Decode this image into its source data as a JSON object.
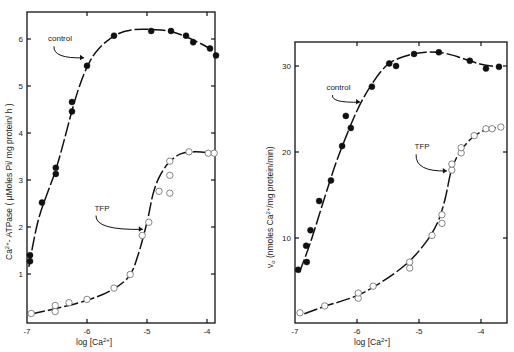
{
  "chart_data": [
    {
      "type": "scatter",
      "panel": "left",
      "title": "",
      "xlabel": "log [Ca2+]",
      "ylabel": "Ca2+-ATPase ( µMoles Pi/ mg protein/ h )",
      "xlim": [
        -7,
        -3.8
      ],
      "ylim": [
        0,
        6.6
      ],
      "xticks": [
        -7,
        -6,
        -5,
        -4
      ],
      "yticks": [
        1,
        2,
        3,
        4,
        5,
        6
      ],
      "grid": false,
      "frame": {
        "left": 27,
        "right": 215,
        "top": 12,
        "bottom": 323,
        "x0px": 27,
        "x1px": 87,
        "y0px": 321,
        "y1px": 274
      },
      "series": [
        {
          "name": "control",
          "marker": "filled-circle",
          "points": [
            [
              -6.95,
              1.27
            ],
            [
              -6.95,
              1.4
            ],
            [
              -6.75,
              2.52
            ],
            [
              -6.52,
              3.13
            ],
            [
              -6.52,
              3.26
            ],
            [
              -6.25,
              4.46
            ],
            [
              -6.25,
              4.66
            ],
            [
              -6.0,
              5.43
            ],
            [
              -5.55,
              6.07
            ],
            [
              -4.93,
              6.17
            ],
            [
              -4.6,
              6.17
            ],
            [
              -4.35,
              6.07
            ],
            [
              -4.23,
              5.93
            ],
            [
              -3.95,
              5.8
            ],
            [
              -3.85,
              5.65
            ]
          ],
          "curve": [
            [
              -6.97,
              1.15
            ],
            [
              -6.8,
              2.2
            ],
            [
              -6.5,
              3.3
            ],
            [
              -6.2,
              4.7
            ],
            [
              -6.0,
              5.4
            ],
            [
              -5.8,
              5.8
            ],
            [
              -5.5,
              6.1
            ],
            [
              -5.2,
              6.2
            ],
            [
              -4.9,
              6.2
            ],
            [
              -4.6,
              6.16
            ],
            [
              -4.3,
              6.02
            ],
            [
              -4.0,
              5.83
            ],
            [
              -3.85,
              5.66
            ]
          ]
        },
        {
          "name": "TFP",
          "marker": "open-circle",
          "points": [
            [
              -6.93,
              0.16
            ],
            [
              -6.53,
              0.2
            ],
            [
              -6.53,
              0.33
            ],
            [
              -6.3,
              0.39
            ],
            [
              -6.0,
              0.46
            ],
            [
              -5.55,
              0.7
            ],
            [
              -5.28,
              0.99
            ],
            [
              -5.08,
              1.82
            ],
            [
              -4.97,
              2.1
            ],
            [
              -4.8,
              2.76
            ],
            [
              -4.62,
              2.72
            ],
            [
              -4.62,
              3.1
            ],
            [
              -4.62,
              3.4
            ],
            [
              -4.3,
              3.6
            ],
            [
              -3.98,
              3.57
            ],
            [
              -3.88,
              3.57
            ]
          ],
          "curve": [
            [
              -6.93,
              0.15
            ],
            [
              -6.5,
              0.27
            ],
            [
              -6.0,
              0.44
            ],
            [
              -5.6,
              0.65
            ],
            [
              -5.3,
              0.95
            ],
            [
              -5.15,
              1.4
            ],
            [
              -5.0,
              2.1
            ],
            [
              -4.9,
              2.7
            ],
            [
              -4.8,
              3.05
            ],
            [
              -4.65,
              3.35
            ],
            [
              -4.45,
              3.55
            ],
            [
              -4.2,
              3.6
            ],
            [
              -3.95,
              3.58
            ]
          ]
        }
      ],
      "annotations": [
        {
          "text": "control",
          "x": -6.45,
          "y": 5.95,
          "arrow_to": [
            -6.05,
            5.6
          ]
        },
        {
          "text": "TFP",
          "x": -5.75,
          "y": 2.35,
          "arrow_to": [
            -5.07,
            1.95
          ]
        }
      ]
    },
    {
      "type": "scatter",
      "panel": "right",
      "title": "",
      "xlabel": "log [Ca2+]",
      "ylabel": "vo (nmoles Ca2+/mg protein/min)",
      "xlim": [
        -7,
        -3.6
      ],
      "ylim": [
        0,
        32.8
      ],
      "xticks": [
        -7,
        -6,
        -5,
        -4
      ],
      "yticks": [
        10,
        20,
        30
      ],
      "grid": false,
      "frame": {
        "left": 295,
        "right": 507,
        "top": 42,
        "bottom": 323,
        "x0px": 295,
        "x1px": 357,
        "y0px": 324,
        "y1px": 238
      },
      "series": [
        {
          "name": "control",
          "marker": "filled-circle",
          "points": [
            [
              -6.95,
              6.3
            ],
            [
              -6.81,
              7.2
            ],
            [
              -6.82,
              9.1
            ],
            [
              -6.75,
              10.9
            ],
            [
              -6.61,
              14.3
            ],
            [
              -6.42,
              16.7
            ],
            [
              -6.24,
              20.7
            ],
            [
              -6.18,
              24.2
            ],
            [
              -6.1,
              22.8
            ],
            [
              -5.76,
              27.6
            ],
            [
              -5.48,
              30.3
            ],
            [
              -5.37,
              30.0
            ],
            [
              -5.08,
              31.4
            ],
            [
              -4.68,
              31.6
            ],
            [
              -4.18,
              30.6
            ],
            [
              -3.92,
              29.7
            ],
            [
              -3.71,
              29.9
            ]
          ],
          "curve": [
            [
              -6.93,
              6.0
            ],
            [
              -6.75,
              9.5
            ],
            [
              -6.5,
              15.2
            ],
            [
              -6.3,
              19.5
            ],
            [
              -6.0,
              24.8
            ],
            [
              -5.75,
              28.0
            ],
            [
              -5.5,
              30.2
            ],
            [
              -5.2,
              31.2
            ],
            [
              -4.9,
              31.6
            ],
            [
              -4.6,
              31.5
            ],
            [
              -4.3,
              30.9
            ],
            [
              -4.0,
              30.2
            ],
            [
              -3.72,
              29.9
            ]
          ]
        },
        {
          "name": "TFP",
          "marker": "open-circle",
          "points": [
            [
              -6.92,
              1.3
            ],
            [
              -6.52,
              2.1
            ],
            [
              -5.98,
              3.0
            ],
            [
              -5.98,
              3.6
            ],
            [
              -5.74,
              4.4
            ],
            [
              -5.15,
              6.5
            ],
            [
              -5.15,
              7.2
            ],
            [
              -4.79,
              10.3
            ],
            [
              -4.63,
              11.7
            ],
            [
              -4.63,
              12.7
            ],
            [
              -4.47,
              17.9
            ],
            [
              -4.47,
              18.6
            ],
            [
              -4.32,
              19.9
            ],
            [
              -4.32,
              20.5
            ],
            [
              -4.11,
              21.9
            ],
            [
              -3.92,
              22.7
            ],
            [
              -3.82,
              22.7
            ],
            [
              -3.68,
              22.9
            ]
          ],
          "curve": [
            [
              -6.85,
              1.2
            ],
            [
              -6.5,
              2.1
            ],
            [
              -6.0,
              3.3
            ],
            [
              -5.6,
              4.9
            ],
            [
              -5.2,
              7.0
            ],
            [
              -4.9,
              9.4
            ],
            [
              -4.7,
              11.8
            ],
            [
              -4.58,
              14.5
            ],
            [
              -4.48,
              17.8
            ],
            [
              -4.35,
              19.9
            ],
            [
              -4.15,
              21.6
            ],
            [
              -3.95,
              22.5
            ],
            [
              -3.68,
              22.9
            ]
          ]
        }
      ],
      "annotations": [
        {
          "text": "control",
          "x": -6.3,
          "y": 27.2,
          "arrow_to": [
            -5.95,
            25.8
          ]
        },
        {
          "text": "TFP",
          "x": -4.95,
          "y": 20.3,
          "arrow_to": [
            -4.55,
            17.8
          ]
        }
      ]
    }
  ],
  "labels": {
    "left_ylabel_main": "Ca",
    "left_ylabel_sup": "2+",
    "left_ylabel_rest": "- ATPase ( µMoles Pi/ mg protein/ h )",
    "right_ylabel_main": "v",
    "right_ylabel_sub": "o",
    "right_ylabel_rest": " (nmoles Ca",
    "right_ylabel_sup": "2+",
    "right_ylabel_end": "/mg protein/min)",
    "xlabel_main": "log [Ca",
    "xlabel_sup": "2+",
    "xlabel_end": "]",
    "left_xtick_labels": [
      "-7",
      "-6",
      "-5",
      "-4"
    ],
    "left_ytick_labels": [
      "1",
      "2",
      "3",
      "4",
      "5",
      "6"
    ],
    "right_xtick_labels": [
      "-7",
      "-6",
      "-5",
      "-4"
    ],
    "right_ytick_labels": [
      "10",
      "20",
      "30"
    ],
    "control_label": "control",
    "tfp_label": "TFP"
  }
}
